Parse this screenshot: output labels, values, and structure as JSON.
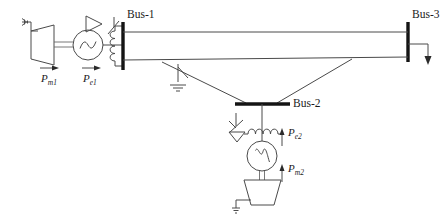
{
  "diagram": {
    "type": "power-system-one-line-diagram",
    "canvas": {
      "width": 448,
      "height": 222
    },
    "colors": {
      "background": "#ffffff",
      "line": "#4a4a4a",
      "bus": "#141414",
      "text": "#1b1b1b",
      "arrow": "#2a2a2a"
    }
  },
  "buses": [
    {
      "id": "bus-1",
      "label": "Bus-1",
      "orientation": "vertical",
      "x": 122,
      "y1": 22,
      "y2": 70
    },
    {
      "id": "bus-2",
      "label": "Bus-2",
      "orientation": "horizontal",
      "y": 105,
      "x1": 235,
      "x2": 288
    },
    {
      "id": "bus-3",
      "label": "Bus-3",
      "orientation": "vertical",
      "x": 408,
      "y1": 22,
      "y2": 62
    }
  ],
  "labels": {
    "bus1": "Bus-1",
    "bus2": "Bus-2",
    "bus3": "Bus-3",
    "pm1": "P",
    "pm1_sub": "m1",
    "pe1": "P",
    "pe1_sub": "e1",
    "pe2": "P",
    "pe2_sub": "e2",
    "pm2": "P",
    "pm2_sub": "m2"
  },
  "units": [
    {
      "id": "unit-1",
      "orientation": "horizontal",
      "turbine": {
        "name": "turbine-1",
        "x": 38,
        "y": 45
      },
      "generator": {
        "name": "generator-1",
        "cx": 88,
        "cy": 45,
        "r": 15
      },
      "transformer": {
        "name": "transformer-1",
        "x": 118,
        "y": 45
      },
      "breaker": {
        "name": "breaker-1",
        "x": 122,
        "y": 26
      },
      "mechanical_power": {
        "label": "P",
        "sub": "m1",
        "direction": "right"
      },
      "electrical_power": {
        "label": "P",
        "sub": "e1",
        "direction": "right"
      }
    },
    {
      "id": "unit-2",
      "orientation": "vertical",
      "transformer": {
        "name": "transformer-2",
        "x": 262,
        "y": 123
      },
      "breaker": {
        "name": "breaker-2",
        "x": 236,
        "y": 122
      },
      "generator": {
        "name": "generator-2",
        "cx": 262,
        "cy": 156,
        "r": 15
      },
      "turbine": {
        "name": "turbine-2",
        "cx": 262,
        "cy": 192
      },
      "electrical_power": {
        "label": "P",
        "sub": "e2",
        "direction": "up"
      },
      "mechanical_power": {
        "label": "P",
        "sub": "m2",
        "direction": "up"
      }
    }
  ],
  "lines": [
    {
      "id": "line-1-3-upper",
      "from": "bus-1",
      "to": "bus-3",
      "path": "horizontal-top"
    },
    {
      "id": "line-1-3-lower",
      "from": "bus-1",
      "to": "bus-3",
      "path": "sloped-with-switch"
    },
    {
      "id": "line-1-2",
      "from": "bus-1",
      "to": "bus-2",
      "path": "diagonal-down-right"
    },
    {
      "id": "line-2-3",
      "from": "bus-2",
      "to": "bus-3",
      "path": "diagonal-up-right"
    }
  ],
  "switch": {
    "id": "grounded-switch",
    "name": "disconnect-switch-with-ground",
    "x": 178,
    "y": 68
  },
  "load": {
    "id": "load-bus-3",
    "name": "load-arrow",
    "x": 428,
    "y": 48,
    "direction": "down"
  },
  "steam_inlets": [
    {
      "unit": "unit-1",
      "x": 22,
      "y": 24
    },
    {
      "unit": "unit-2",
      "x": 240,
      "y": 205
    }
  ]
}
